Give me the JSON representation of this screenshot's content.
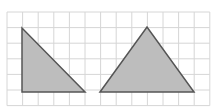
{
  "diagram": {
    "grid": {
      "x0": 7,
      "y0": 12,
      "cell": 15.6,
      "cols": 13,
      "rows": 6,
      "color": "#d6d6d6"
    },
    "shapes": [
      {
        "name": "right-triangle",
        "points": "22,28 22,92 85,92",
        "fill": "#bdbdbd",
        "stroke": "#555555"
      },
      {
        "name": "isosceles-triangle",
        "points": "100,92 147,27 194,92",
        "fill": "#bdbdbd",
        "stroke": "#555555"
      }
    ]
  }
}
